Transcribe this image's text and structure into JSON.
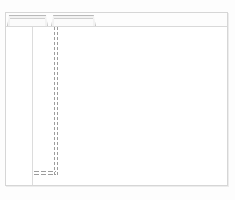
{
  "window": {
    "title": "",
    "frame_color": "#d6d6d6",
    "background_color": "#ffffff",
    "page_background_color": "#fdfdfd"
  },
  "tab_strip": {
    "rule_color": "#d9d9d9",
    "tabs": [
      {
        "label": "",
        "state": "inactive"
      },
      {
        "label": "",
        "state": "inactive"
      }
    ]
  },
  "sidebar": {
    "label": "",
    "divider_color": "#dcdcdc",
    "items": []
  },
  "canvas": {
    "label": "",
    "content": ""
  },
  "selection_path": {
    "label": "",
    "stroke_color": "#9d9d9d",
    "style": "dashed",
    "segments": [
      {
        "orientation": "vertical",
        "label": ""
      },
      {
        "orientation": "horizontal",
        "label": ""
      }
    ]
  }
}
